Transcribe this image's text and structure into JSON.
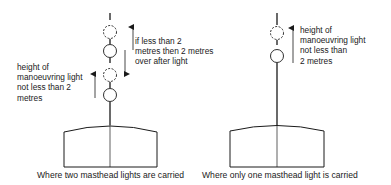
{
  "diagram": {
    "colors": {
      "line": "#1a1a1a",
      "background": "#ffffff"
    },
    "left": {
      "caption": "Where two masthead lights are carried",
      "label_manoeuvring": [
        "height of",
        "manoeuvring light",
        "not less than 2",
        "metres"
      ],
      "label_after_light": [
        "if less than 2",
        "metres then 2 metres",
        "over after light"
      ],
      "lights": [
        {
          "type": "dashed",
          "role": "upper-optional-position"
        },
        {
          "type": "solid",
          "role": "masthead-light"
        },
        {
          "type": "dashed",
          "role": "manoeuvring-light-position"
        },
        {
          "type": "solid",
          "role": "masthead-light"
        }
      ]
    },
    "right": {
      "caption": "Where only one masthead light is carried",
      "label_manoeuvring": [
        "height of",
        "manoeuvring light",
        "not less than",
        "2 metres"
      ],
      "lights": [
        {
          "type": "dashed",
          "role": "manoeuvring-light-position"
        },
        {
          "type": "solid",
          "role": "masthead-light"
        }
      ]
    }
  }
}
